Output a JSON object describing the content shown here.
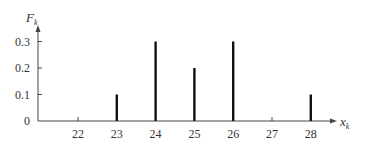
{
  "chart_data": {
    "type": "bar",
    "subtype": "stem",
    "title": "",
    "xlabel": "x_k",
    "ylabel": "F_k",
    "x_ticks": [
      22,
      23,
      24,
      25,
      26,
      27,
      28
    ],
    "y_ticks": [
      "0",
      "0.1",
      "0.2",
      "0.3"
    ],
    "ylim": [
      0,
      0.35
    ],
    "xlim": [
      21,
      28.8
    ],
    "grid": false,
    "legend": null,
    "categories": [
      23,
      24,
      25,
      26,
      28
    ],
    "values": [
      0.1,
      0.3,
      0.2,
      0.3,
      0.1
    ]
  },
  "labels": {
    "y_axis_main": "F",
    "y_axis_sub": "k",
    "x_axis_main": "x",
    "x_axis_sub": "k"
  }
}
